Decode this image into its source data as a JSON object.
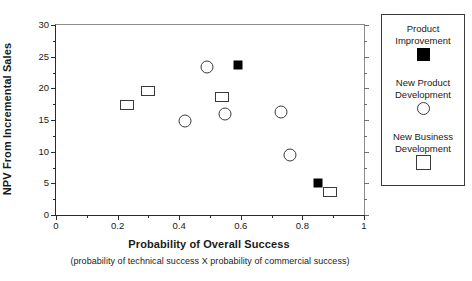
{
  "chart_data": {
    "type": "scatter",
    "title": "",
    "xlabel": "Probability of Overall Success",
    "xsublabel": "(probability of technical success X probability of commercial success)",
    "ylabel": "NPV From Incremental Sales",
    "xlim": [
      0,
      1
    ],
    "ylim": [
      0,
      30
    ],
    "xticks": [
      "0",
      "0.2",
      "0.4",
      "0.6",
      "0.8",
      "1"
    ],
    "xtick_values": [
      0,
      0.2,
      0.4,
      0.6,
      0.8,
      1
    ],
    "xminor_values": [
      0.1,
      0.3,
      0.5,
      0.7,
      0.9
    ],
    "yticks": [
      "0",
      "5",
      "10",
      "15",
      "20",
      "25",
      "30"
    ],
    "ytick_values": [
      0,
      5,
      10,
      15,
      20,
      25,
      30
    ],
    "yminor_values": [
      2.5,
      7.5,
      12.5,
      17.5,
      22.5,
      27.5
    ],
    "grid": false,
    "legend_position": "right-outside",
    "series": [
      {
        "name": "Product Improvement",
        "marker": "filled-square",
        "color": "#000000",
        "points": [
          {
            "x": 0.59,
            "y": 23.7
          },
          {
            "x": 0.85,
            "y": 5.0
          }
        ]
      },
      {
        "name": "New Product Development",
        "marker": "open-circle",
        "color": "#3a3a3a",
        "points": [
          {
            "x": 0.42,
            "y": 14.8
          },
          {
            "x": 0.49,
            "y": 23.3
          },
          {
            "x": 0.55,
            "y": 16.0
          },
          {
            "x": 0.73,
            "y": 16.3
          },
          {
            "x": 0.76,
            "y": 9.5
          }
        ]
      },
      {
        "name": "New Business Development",
        "marker": "open-square",
        "color": "#3a3a3a",
        "points": [
          {
            "x": 0.23,
            "y": 17.3
          },
          {
            "x": 0.3,
            "y": 19.6
          },
          {
            "x": 0.54,
            "y": 18.6
          },
          {
            "x": 0.89,
            "y": 3.7
          }
        ]
      }
    ]
  },
  "legend": {
    "entries": [
      {
        "label_line1": "Product",
        "label_line2": "Improvement",
        "swatch": "filled-square-icon"
      },
      {
        "label_line1": "New Product",
        "label_line2": "Development",
        "swatch": "open-circle-icon"
      },
      {
        "label_line1": "New Business",
        "label_line2": "Development",
        "swatch": "open-square-icon"
      }
    ]
  }
}
